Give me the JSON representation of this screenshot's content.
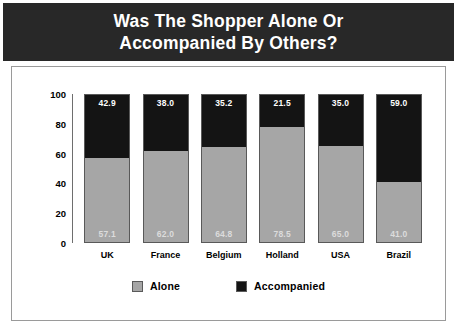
{
  "title": {
    "line1": "Was The Shopper Alone Or",
    "line2": "Accompanied By Others?",
    "full": "Was The Shopper Alone Or\nAccompanied By Others?"
  },
  "colors": {
    "title_band": "#282828",
    "title_text": "#ffffff",
    "alone": "#a6a6a6",
    "accompanied": "#141414",
    "panel_border": "#9a9a9a",
    "axis": "#6e6e6e",
    "background": "#ffffff"
  },
  "legend": {
    "position": "bottom",
    "items": [
      {
        "label": "Alone",
        "color": "#a6a6a6"
      },
      {
        "label": "Accompanied",
        "color": "#141414"
      }
    ]
  },
  "axis": {
    "y_ticks": [
      "100",
      "80",
      "60",
      "40",
      "20",
      "0"
    ]
  },
  "chart_data": {
    "type": "bar",
    "subtype": "stacked-bar-100-percent",
    "title": "Was The Shopper Alone Or Accompanied By Others?",
    "subtitle": "",
    "xlabel": "",
    "ylabel": "",
    "ylim": [
      0,
      100
    ],
    "ytick_values": [
      0,
      20,
      40,
      60,
      80,
      100
    ],
    "grid": false,
    "legend_position": "bottom",
    "categories": [
      "UK",
      "France",
      "Belgium",
      "Holland",
      "USA",
      "Brazil"
    ],
    "series": [
      {
        "name": "Alone",
        "color": "#a6a6a6",
        "values": [
          57.1,
          62.0,
          64.8,
          78.5,
          65.0,
          41.0
        ],
        "labels": [
          "57.1",
          "62.0",
          "64.8",
          "78.5",
          "65.0",
          "41.0"
        ]
      },
      {
        "name": "Accompanied",
        "color": "#141414",
        "values": [
          42.9,
          38.0,
          35.2,
          21.5,
          35.0,
          59.0
        ],
        "labels": [
          "42.9",
          "38.0",
          "35.2",
          "21.5",
          "35.0",
          "59.0"
        ]
      }
    ]
  }
}
